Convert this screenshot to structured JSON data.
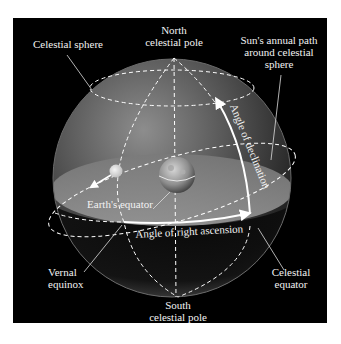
{
  "diagram": {
    "colors": {
      "background": "#ffffff",
      "panel": "#000000",
      "sphere_light": "#9a9a9a",
      "sphere_dark": "#1a1a1a",
      "label_text": "#f2f2f2",
      "lines": "#ffffff"
    },
    "labels": {
      "celestial_sphere": "Celestial sphere",
      "north_pole_line1": "North",
      "north_pole_line2": "celestial pole",
      "sun_path_line1": "Sun's annual path",
      "sun_path_line2": "around celestial",
      "sun_path_line3": "sphere",
      "angle_declination": "Angle of declination",
      "earths_equator": "Earth's equator",
      "angle_right_ascension": "Angle of right ascension",
      "vernal_line1": "Vernal",
      "vernal_line2": "equinox",
      "celestial_equator_line1": "Celestial",
      "celestial_equator_line2": "equator",
      "south_pole_line1": "South",
      "south_pole_line2": "celestial pole"
    },
    "elements": {
      "sphere": "celestial-sphere",
      "earth": "earth-globe",
      "sun": "sun-dot",
      "celestial_equator_plane": "equatorial-plane",
      "ecliptic": "ecliptic-dashed-ellipse"
    }
  }
}
